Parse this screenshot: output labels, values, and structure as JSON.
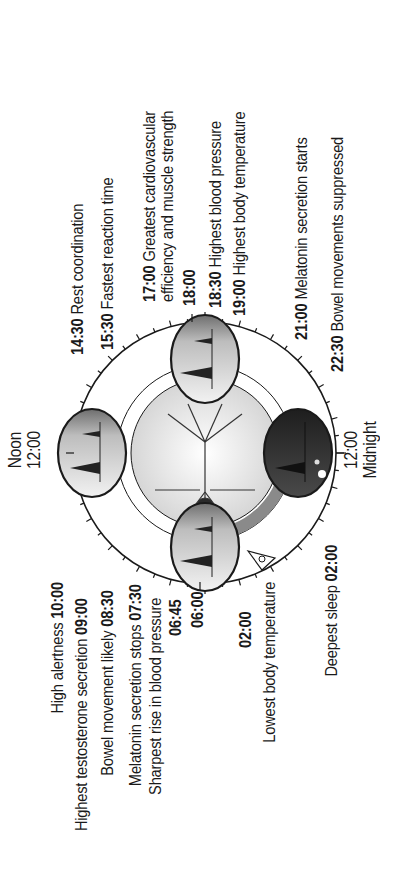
{
  "clock": {
    "top": {
      "label": "Noon",
      "time": "12:00"
    },
    "bottom": {
      "time": "12:00",
      "label": "Midnight"
    }
  },
  "morning_events": [
    {
      "text": "High alertness",
      "time": "10:00"
    },
    {
      "text": "Highest testosterone secretion",
      "time": "09:00"
    },
    {
      "text": "Bowel movement likely",
      "time": "08:30"
    },
    {
      "text": "Melatonin secretion stops",
      "time": "07:30"
    },
    {
      "text": "Sharpest rise in blood pressure",
      "time": ""
    },
    {
      "text": "",
      "time": "06:45"
    },
    {
      "text": "",
      "time": "06:00"
    }
  ],
  "night_events": [
    {
      "text": "",
      "time": "02:00"
    },
    {
      "text": "Lowest body temperature",
      "time": ""
    },
    {
      "text": "Deepest sleep",
      "time": "02:00"
    }
  ],
  "afternoon_events": [
    {
      "time": "14:30",
      "text": "Rest coordination"
    },
    {
      "time": "15:30",
      "text": "Fastest reaction time"
    },
    {
      "time": "17:00",
      "text": "Greatest cardiovascular"
    },
    {
      "time": "",
      "text": "efficiency and muscle strength"
    },
    {
      "time": "18:00",
      "text": ""
    },
    {
      "time": "18:30",
      "text": "Highest blood pressure"
    },
    {
      "time": "19:00",
      "text": "Highest body temperature"
    }
  ],
  "evening_events": [
    {
      "time": "21:00",
      "text": "Melatonin secretion starts"
    },
    {
      "time": "22:30",
      "text": "Bowel movements suppressed"
    }
  ],
  "colors": {
    "ink": "#1a1a1a",
    "ring": "#8a8a8a",
    "day_scene": "#cfcfcf",
    "night_scene": "#3a3a3a",
    "center_glow": "#e8e8e8"
  }
}
